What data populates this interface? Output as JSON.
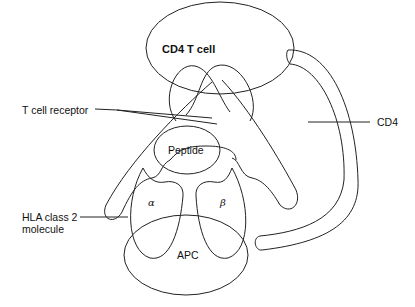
{
  "diagram": {
    "title": "",
    "labels": {
      "cd4_t_cell": "CD4 T cell",
      "t_cell_receptor": "T cell receptor",
      "cd4": "CD4",
      "peptide": "Peptide",
      "alpha": "α",
      "beta": "β",
      "hla_line1": "HLA class 2",
      "hla_line2": "molecule",
      "apc": "APC"
    },
    "colors": {
      "stroke": "#222222",
      "background": "#ffffff"
    }
  }
}
